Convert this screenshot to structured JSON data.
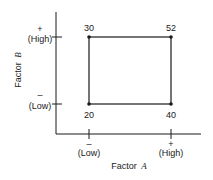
{
  "diagram": {
    "type": "2x2 factorial design square",
    "y_axis": {
      "label": "Factor",
      "label_var": "B",
      "high_sign": "+",
      "high_label": "(High)",
      "low_sign": "–",
      "low_label": "(Low)"
    },
    "x_axis": {
      "label": "Factor",
      "label_var": "A",
      "low_sign": "–",
      "low_label": "(Low)",
      "high_sign": "+",
      "high_label": "(High)"
    },
    "corners": {
      "low_a_low_b": "20",
      "high_a_low_b": "40",
      "low_a_high_b": "30",
      "high_a_high_b": "52"
    },
    "colors": {
      "line": "#1a1a1a",
      "background": "#ffffff"
    }
  }
}
